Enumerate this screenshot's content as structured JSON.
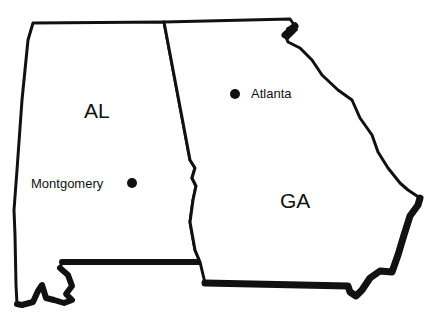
{
  "map": {
    "title": "",
    "colors": {
      "outline": "#111111",
      "fill": "#ffffff",
      "background": "#ffffff"
    },
    "states": [
      {
        "abbr": "AL",
        "name": "Alabama"
      },
      {
        "abbr": "GA",
        "name": "Georgia"
      }
    ],
    "cities": [
      {
        "name": "Montgomery",
        "state": "AL"
      },
      {
        "name": "Atlanta",
        "state": "GA"
      }
    ]
  }
}
